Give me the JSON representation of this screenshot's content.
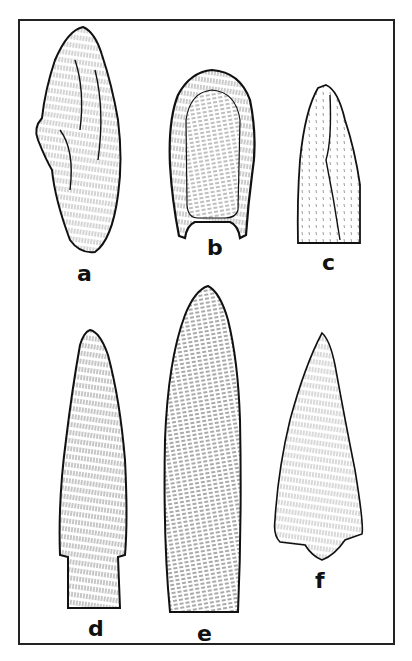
{
  "plate": {
    "description": "Line drawing plate of six chipped stone projectile points",
    "frame_color": "#222222",
    "ink_color": "#111111",
    "background": "#ffffff"
  },
  "figures": [
    {
      "id": "a",
      "label": "a",
      "shape": "irregular leaf-shaped blade"
    },
    {
      "id": "b",
      "label": "b",
      "shape": "fluted point with concave base"
    },
    {
      "id": "c",
      "label": "c",
      "shape": "lanceolate point with straight base"
    },
    {
      "id": "d",
      "label": "d",
      "shape": "long lanceolate point with stemmed base"
    },
    {
      "id": "e",
      "label": "e",
      "shape": "long parallel-flaked lanceolate point"
    },
    {
      "id": "f",
      "label": "f",
      "shape": "triangular point with small stem"
    }
  ]
}
